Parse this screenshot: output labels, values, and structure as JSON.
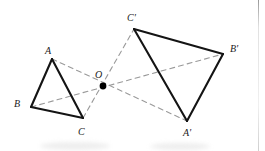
{
  "figure": {
    "width": 265,
    "height": 151,
    "background_color": "#ffffff",
    "solid_stroke_color": "#141414",
    "dashed_stroke_color": "#9a9a9a",
    "point_color": "#000000",
    "label_color": "#1a1a1a"
  },
  "labels": {
    "A": "A",
    "B": "B",
    "C": "C",
    "O": "O",
    "A_prime": "A'",
    "B_prime": "B'",
    "C_prime": "C'"
  },
  "chart_data": {
    "type": "diagram",
    "coordinate_system": "pixels, origin top-left, y increases downward",
    "points": [
      {
        "name": "A",
        "x": 52,
        "y": 59,
        "label": "A",
        "label_x": 45,
        "label_y": 46
      },
      {
        "name": "B",
        "x": 31,
        "y": 107,
        "label": "B",
        "label_x": 14,
        "label_y": 99
      },
      {
        "name": "C",
        "x": 83,
        "y": 118,
        "label": "C",
        "label_x": 78,
        "label_y": 127
      },
      {
        "name": "O",
        "x": 103,
        "y": 86,
        "label": "O",
        "label_x": 95,
        "label_y": 70
      },
      {
        "name": "A'",
        "x": 187,
        "y": 121,
        "label": "A'",
        "label_x": 183,
        "label_y": 128
      },
      {
        "name": "B'",
        "x": 223,
        "y": 54,
        "label": "B'",
        "label_x": 230,
        "label_y": 44
      },
      {
        "name": "C'",
        "x": 134,
        "y": 29,
        "label": "C'",
        "label_x": 127,
        "label_y": 13
      }
    ],
    "solid_edges": [
      {
        "from": "A",
        "to": "B"
      },
      {
        "from": "B",
        "to": "C"
      },
      {
        "from": "C",
        "to": "A"
      },
      {
        "from": "A'",
        "to": "B'"
      },
      {
        "from": "B'",
        "to": "C'"
      },
      {
        "from": "C'",
        "to": "A'"
      }
    ],
    "dashed_lines": [
      {
        "from": "A",
        "to": "A'",
        "through": "O"
      },
      {
        "from": "B",
        "to": "B'",
        "through": "O"
      },
      {
        "from": "C",
        "to": "C'",
        "through": "O"
      }
    ],
    "marked_points": [
      "O"
    ],
    "dash_pattern": "5 4"
  },
  "artifacts": {
    "right_edge_line_x": 258,
    "smudges": [
      {
        "x": 40,
        "y": 142,
        "w": 70,
        "h": 8
      },
      {
        "x": 150,
        "y": 143,
        "w": 60,
        "h": 7
      }
    ]
  }
}
